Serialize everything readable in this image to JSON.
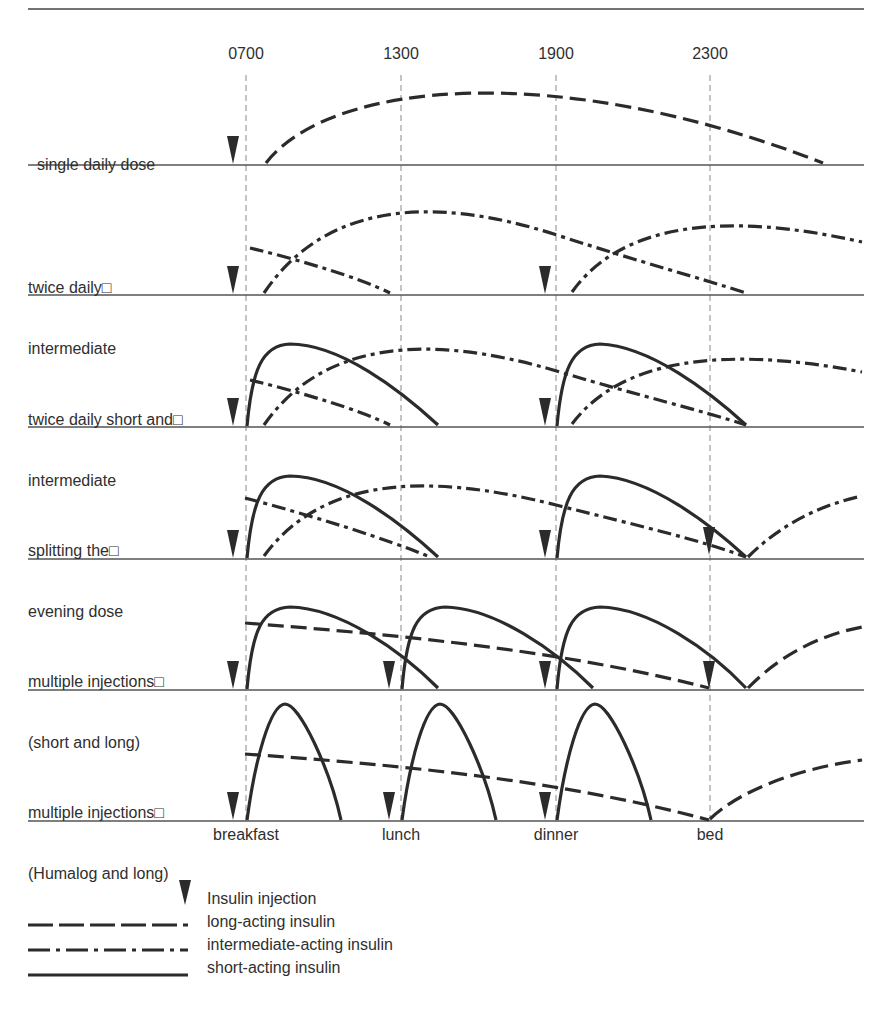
{
  "figure": {
    "time_ticks": [
      {
        "label": "0700",
        "x": 246
      },
      {
        "label": "1300",
        "x": 401
      },
      {
        "label": "1900",
        "x": 556
      },
      {
        "label": "2300",
        "x": 710
      }
    ],
    "meal_labels": [
      {
        "label": "breakfast",
        "x": 246
      },
      {
        "label": "lunch",
        "x": 401
      },
      {
        "label": "dinner",
        "x": 556
      },
      {
        "label": "bed",
        "x": 710
      }
    ],
    "rows": [
      {
        "label_line1": "single daily dose",
        "label_line2": "",
        "baseline_y": 165
      },
      {
        "label_line1": "twice daily□",
        "label_line2": "intermediate",
        "baseline_y": 295
      },
      {
        "label_line1": "twice daily short and□",
        "label_line2": "intermediate",
        "baseline_y": 427
      },
      {
        "label_line1": "splitting the□",
        "label_line2": "evening dose",
        "baseline_y": 559
      },
      {
        "label_line1": "multiple injections□",
        "label_line2": "(short and long)",
        "baseline_y": 690
      },
      {
        "label_line1": "multiple injections□",
        "label_line2": "(Humalog and long)",
        "baseline_y": 821
      }
    ]
  },
  "legend": {
    "injection": "Insulin injection",
    "long": "long-acting insulin",
    "intermediate": "intermediate-acting insulin",
    "short": "short-acting insulin"
  },
  "colors": {
    "ink": "#2b2b2b",
    "grid": "#8a8a8a"
  }
}
